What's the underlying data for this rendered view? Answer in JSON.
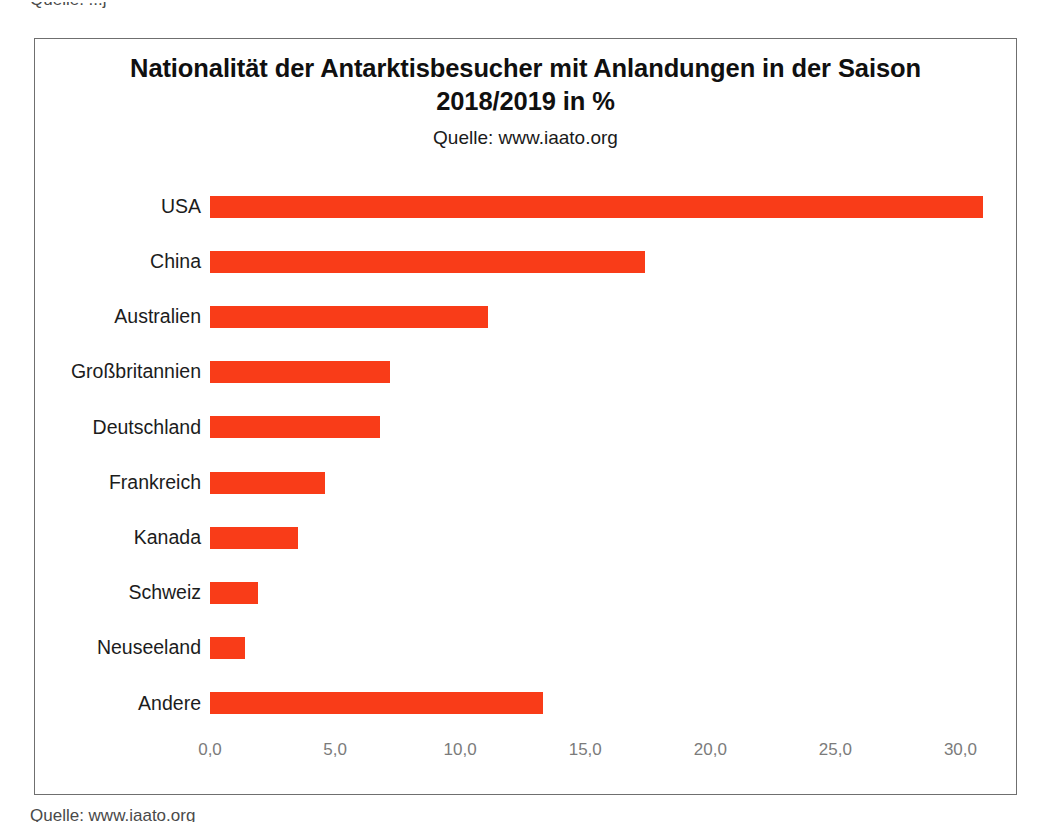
{
  "page": {
    "scan_fragment_top": "Quelle: ...j",
    "scan_fragment_bottom": "Quelle: www.iaato.org"
  },
  "chart_data": {
    "type": "bar",
    "orientation": "horizontal",
    "title": "Nationalität der Antarktisbesucher mit Anlandungen in der Saison 2018/2019 in %",
    "subtitle": "Quelle: www.iaato.org",
    "categories": [
      "USA",
      "China",
      "Australien",
      "Großbritannien",
      "Deutschland",
      "Frankreich",
      "Kanada",
      "Schweiz",
      "Neuseeland",
      "Andere"
    ],
    "values": [
      30.9,
      17.4,
      11.1,
      7.2,
      6.8,
      4.6,
      3.5,
      1.9,
      1.4,
      13.3
    ],
    "xlabel": "",
    "ylabel": "",
    "xlim": [
      0,
      32.3
    ],
    "xticks": [
      0,
      5,
      10,
      15,
      20,
      25,
      30
    ],
    "xtick_labels": [
      "0,0",
      "5,0",
      "10,0",
      "15,0",
      "20,0",
      "25,0",
      "30,0"
    ],
    "bar_color": "#f93c18",
    "grid": false,
    "legend": false
  }
}
